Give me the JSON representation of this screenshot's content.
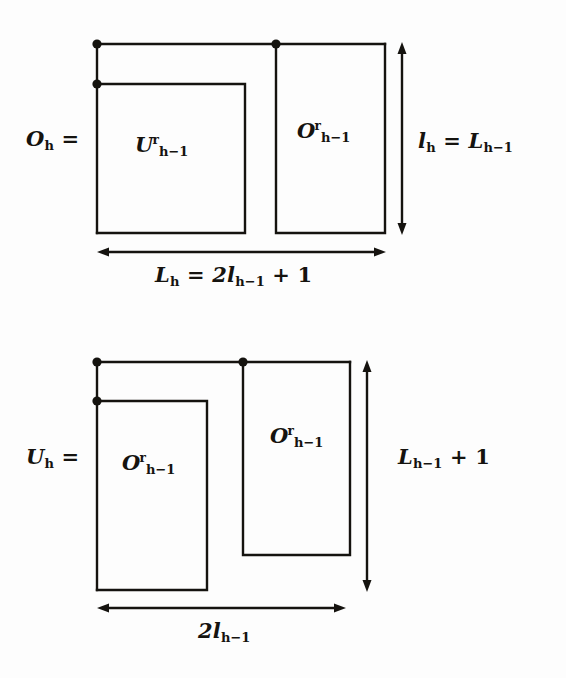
{
  "figure": {
    "background_color": "#fdfdfd",
    "ink_color": "#15130f",
    "panels": [
      {
        "id": "panel-upper",
        "lhs_label": "O",
        "lhs_sub": "h",
        "lhs_eq": "=",
        "left_box_label": "U",
        "left_box_sup": "r",
        "left_box_sub": "h−1",
        "right_box_label": "O",
        "right_box_sup": "r",
        "right_box_sub": "h−1",
        "vertical_dim_text": "l",
        "vertical_dim_sub": "h",
        "vertical_dim_eq": "=",
        "vertical_dim_rhs": "L",
        "vertical_dim_rhs_sub": "h−1",
        "horizontal_dim_lhs": "L",
        "horizontal_dim_lhs_sub": "h",
        "horizontal_dim_eq": "=",
        "horizontal_dim_rhs_coef": "2l",
        "horizontal_dim_rhs_sub": "h−1",
        "horizontal_dim_rhs_tail": "+ 1"
      },
      {
        "id": "panel-lower",
        "lhs_label": "U",
        "lhs_sub": "h",
        "lhs_eq": "=",
        "left_box_label": "O",
        "left_box_sup": "r",
        "left_box_sub": "h−1",
        "right_box_label": "O",
        "right_box_sup": "r",
        "right_box_sub": "h−1",
        "vertical_dim_text": "L",
        "vertical_dim_sub": "h−1",
        "vertical_dim_tail": "+ 1",
        "horizontal_dim_text": "2l",
        "horizontal_dim_sub": "h−1"
      }
    ],
    "markers": {
      "dot_name": "corner-dot",
      "dot_count": 6
    }
  }
}
